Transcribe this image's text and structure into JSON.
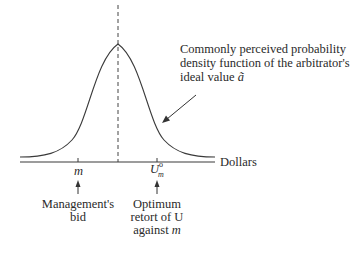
{
  "diagram": {
    "annotation": {
      "lines": [
        "Commonly perceived probability",
        "density function of the arbitrator's",
        "ideal value "
      ],
      "symbol": "ã"
    },
    "axis_label": "Dollars",
    "ticks": [
      {
        "symbol": "m",
        "caption_lines": [
          "Management's",
          "bid"
        ]
      },
      {
        "symbol": "U",
        "superscript": "o",
        "subscript": "m",
        "caption_lines": [
          "Optimum",
          "retort of U",
          "against "
        ],
        "caption_italic_tail": "m"
      }
    ],
    "colors": {
      "line": "#3a3a3a",
      "text": "#2a2a2a",
      "background": "#ffffff"
    }
  }
}
